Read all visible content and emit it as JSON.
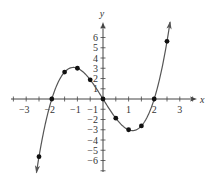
{
  "chart_data": {
    "type": "line",
    "title": "",
    "function": "y = x^3 - 4x",
    "xlabel": "x",
    "ylabel": "y",
    "xlim": [
      -3.5,
      3.6
    ],
    "ylim": [
      -7.2,
      7.5
    ],
    "x_ticks": [
      -3,
      -2,
      -1,
      0,
      1,
      2,
      3
    ],
    "x_tick_labels": [
      "−3",
      "−2",
      "−1",
      "",
      "1",
      "2",
      "3"
    ],
    "y_ticks": [
      -6,
      -5,
      -4,
      -3,
      -2,
      -1,
      1,
      2,
      3,
      4,
      5,
      6
    ],
    "y_tick_labels": [
      "−6",
      "−5",
      "−4",
      "−3",
      "−2",
      "−1",
      "1",
      "2",
      "3",
      "4",
      "5",
      "6"
    ],
    "grid": false,
    "points": [
      {
        "x": -2.5,
        "y": -5.625
      },
      {
        "x": -2,
        "y": 0
      },
      {
        "x": -1.5,
        "y": 2.625
      },
      {
        "x": -1,
        "y": 3
      },
      {
        "x": -0.5,
        "y": 1.875
      },
      {
        "x": 0,
        "y": 0
      },
      {
        "x": 0.5,
        "y": -1.875
      },
      {
        "x": 1,
        "y": -3
      },
      {
        "x": 1.5,
        "y": -2.625
      },
      {
        "x": 2,
        "y": 0
      },
      {
        "x": 2.5,
        "y": 5.625
      }
    ],
    "curve_x_range": [
      -2.6,
      2.62
    ],
    "colors": {
      "axis": "#444444",
      "curve": "#555555",
      "point": "#111111"
    }
  }
}
